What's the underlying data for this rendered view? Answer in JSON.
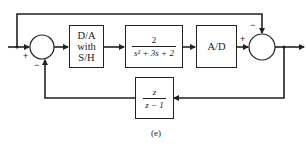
{
  "diagram": {
    "blocks": {
      "dac": {
        "lines": [
          "D/A",
          "with",
          "S/H"
        ]
      },
      "plant": {
        "numerator": "2",
        "denominator": "s² + 3s + 2"
      },
      "adc": {
        "label": "A/D"
      },
      "feedback": {
        "numerator": "z",
        "denominator": "z − 1"
      }
    },
    "summers": {
      "left": {
        "input_sign": "+",
        "feedback_sign": "−"
      },
      "right": {
        "input_sign": "+",
        "feedforward_sign": "−"
      }
    },
    "caption": "(e)",
    "colors": {
      "line": "#222222",
      "background": "#ffffff"
    }
  }
}
